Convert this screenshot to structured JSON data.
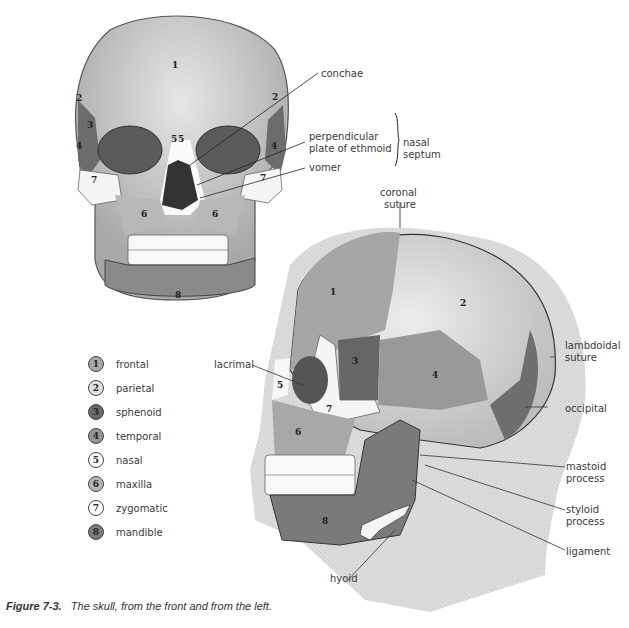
{
  "figure": {
    "caption_label": "Figure 7-3.",
    "caption_text": "The skull, from the front and from the left."
  },
  "front_view": {
    "numbers": [
      "1",
      "2",
      "3",
      "4",
      "5",
      "5",
      "7",
      "6",
      "6",
      "8",
      "2",
      "4",
      "7"
    ],
    "labels": {
      "conchae": "conchae",
      "perpendicular_plate": [
        "perpendicular",
        "plate of ethmoid"
      ],
      "vomer": "vomer",
      "nasal_septum": [
        "nasal",
        "septum"
      ]
    }
  },
  "side_view": {
    "numbers": [
      "1",
      "2",
      "3",
      "4",
      "5",
      "6",
      "7",
      "8"
    ],
    "labels": {
      "coronal_suture": [
        "coronal",
        "suture"
      ],
      "lambdoidal_suture": [
        "lambdoidal",
        "suture"
      ],
      "occipital": "occipital",
      "mastoid_process": [
        "mastoid",
        "process"
      ],
      "styloid_process": [
        "styloid",
        "process"
      ],
      "ligament": "ligament",
      "hyoid": "hyoid",
      "lacrimal": "lacrimal"
    }
  },
  "legend": [
    {
      "num": "1",
      "name": "frontal",
      "color": "#a8a8a8"
    },
    {
      "num": "2",
      "name": "parietal",
      "color": "#e0e0e0"
    },
    {
      "num": "3",
      "name": "sphenoid",
      "color": "#6a6a6a"
    },
    {
      "num": "4",
      "name": "temporal",
      "color": "#959595"
    },
    {
      "num": "5",
      "name": "nasal",
      "color": "#ffffff"
    },
    {
      "num": "6",
      "name": "maxilla",
      "color": "#b4b4b4"
    },
    {
      "num": "7",
      "name": "zygomatic",
      "color": "#ffffff"
    },
    {
      "num": "8",
      "name": "mandible",
      "color": "#7c7c7c"
    }
  ]
}
